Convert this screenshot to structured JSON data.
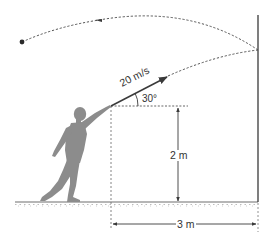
{
  "diagram": {
    "type": "projectile-motion",
    "colors": {
      "line": "#3a3a3a",
      "dashed_path": "#555555",
      "figure": "#8a8a8a",
      "ground": "#777777"
    },
    "labels": {
      "velocity": "20 m/s",
      "angle": "30°",
      "height": "2 m",
      "distance": "3 m"
    },
    "elements": [
      {
        "id": "thrower",
        "kind": "silhouette"
      },
      {
        "id": "velocity-vector",
        "kind": "arrow",
        "label": "20 m/s"
      },
      {
        "id": "launch-angle",
        "kind": "angle-arc",
        "label": "30°"
      },
      {
        "id": "outgoing-path",
        "kind": "dashed-curve"
      },
      {
        "id": "wall",
        "kind": "vertical-line"
      },
      {
        "id": "return-path",
        "kind": "dashed-curve-with-arrow"
      },
      {
        "id": "ball",
        "kind": "dot"
      },
      {
        "id": "height-dimension",
        "kind": "dimension-line",
        "label": "2 m"
      },
      {
        "id": "distance-dimension",
        "kind": "dimension-line",
        "label": "3 m"
      },
      {
        "id": "ground",
        "kind": "hatched-line"
      }
    ]
  }
}
